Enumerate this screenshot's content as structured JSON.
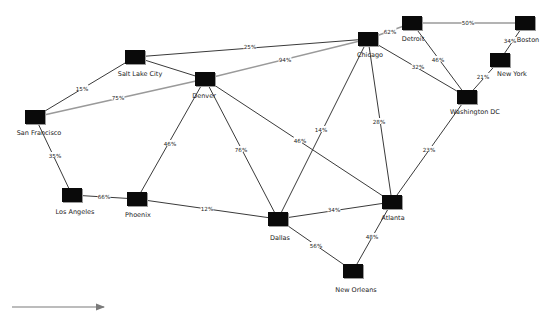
{
  "diagram": {
    "type": "network-graph",
    "nodes": [
      {
        "id": "slc",
        "label": "Salt Lake City",
        "x": 135,
        "y": 57,
        "lx": 140,
        "ly": 76
      },
      {
        "id": "den",
        "label": "Denver",
        "x": 205,
        "y": 79,
        "lx": 204,
        "ly": 98
      },
      {
        "id": "sf",
        "label": "San Francisco",
        "x": 35,
        "y": 117,
        "lx": 39,
        "ly": 135
      },
      {
        "id": "chi",
        "label": "Chicago",
        "x": 368,
        "y": 39,
        "lx": 370,
        "ly": 57
      },
      {
        "id": "det",
        "label": "Detroit",
        "x": 412,
        "y": 23,
        "lx": 413,
        "ly": 41
      },
      {
        "id": "bos",
        "label": "Boston",
        "x": 525,
        "y": 23,
        "lx": 528,
        "ly": 42
      },
      {
        "id": "ny",
        "label": "New York",
        "x": 500,
        "y": 60,
        "lx": 512,
        "ly": 76
      },
      {
        "id": "dc",
        "label": "Washington DC",
        "x": 467,
        "y": 97,
        "lx": 475,
        "ly": 114
      },
      {
        "id": "la",
        "label": "Los Angeles",
        "x": 72,
        "y": 195,
        "lx": 75,
        "ly": 214
      },
      {
        "id": "phx",
        "label": "Phoenix",
        "x": 137,
        "y": 199,
        "lx": 138,
        "ly": 217
      },
      {
        "id": "dal",
        "label": "Dallas",
        "x": 278,
        "y": 219,
        "lx": 280,
        "ly": 240
      },
      {
        "id": "atl",
        "label": "Atlanta",
        "x": 392,
        "y": 202,
        "lx": 393,
        "ly": 220
      },
      {
        "id": "no",
        "label": "New Orleans",
        "x": 353,
        "y": 271,
        "lx": 356,
        "ly": 292
      }
    ],
    "edges": [
      {
        "from": "sf",
        "to": "slc",
        "label": "15%",
        "lx": 82,
        "ly": 89,
        "style": "normal"
      },
      {
        "from": "sf",
        "to": "den",
        "label": "75%",
        "lx": 118,
        "ly": 98,
        "style": "highlight"
      },
      {
        "from": "slc",
        "to": "chi",
        "label": "25%",
        "lx": 250,
        "ly": 47,
        "style": "normal"
      },
      {
        "from": "slc",
        "to": "den",
        "label": "",
        "lx": 0,
        "ly": 0,
        "style": "normal"
      },
      {
        "from": "den",
        "to": "chi",
        "label": "94%",
        "lx": 285,
        "ly": 60,
        "style": "highlight"
      },
      {
        "from": "sf",
        "to": "la",
        "label": "35%",
        "lx": 55,
        "ly": 156,
        "style": "normal"
      },
      {
        "from": "den",
        "to": "phx",
        "label": "46%",
        "lx": 170,
        "ly": 144,
        "style": "normal"
      },
      {
        "from": "den",
        "to": "dal",
        "label": "76%",
        "lx": 241,
        "ly": 150,
        "style": "normal"
      },
      {
        "from": "den",
        "to": "atl",
        "label": "46%",
        "lx": 300,
        "ly": 141,
        "style": "normal"
      },
      {
        "from": "la",
        "to": "phx",
        "label": "66%",
        "lx": 104,
        "ly": 197,
        "style": "normal"
      },
      {
        "from": "phx",
        "to": "dal",
        "label": "12%",
        "lx": 207,
        "ly": 209,
        "style": "normal"
      },
      {
        "from": "chi",
        "to": "dal",
        "label": "14%",
        "lx": 321,
        "ly": 130,
        "style": "normal"
      },
      {
        "from": "chi",
        "to": "atl",
        "label": "28%",
        "lx": 379,
        "ly": 122,
        "style": "normal"
      },
      {
        "from": "chi",
        "to": "det",
        "label": "62%",
        "lx": 390,
        "ly": 32,
        "style": "highlight"
      },
      {
        "from": "chi",
        "to": "dc",
        "label": "32%",
        "lx": 418,
        "ly": 67,
        "style": "normal"
      },
      {
        "from": "det",
        "to": "dc",
        "label": "46%",
        "lx": 438,
        "ly": 60,
        "style": "normal"
      },
      {
        "from": "det",
        "to": "bos",
        "label": "50%",
        "lx": 468,
        "ly": 23,
        "style": "highlight"
      },
      {
        "from": "bos",
        "to": "ny",
        "label": "34%",
        "lx": 510,
        "ly": 41,
        "style": "normal"
      },
      {
        "from": "ny",
        "to": "dc",
        "label": "21%",
        "lx": 483,
        "ly": 77,
        "style": "normal"
      },
      {
        "from": "dc",
        "to": "atl",
        "label": "23%",
        "lx": 429,
        "ly": 150,
        "style": "normal"
      },
      {
        "from": "dal",
        "to": "atl",
        "label": "34%",
        "lx": 334,
        "ly": 210,
        "style": "normal"
      },
      {
        "from": "dal",
        "to": "no",
        "label": "56%",
        "lx": 316,
        "ly": 246,
        "style": "normal"
      },
      {
        "from": "atl",
        "to": "no",
        "label": "48%",
        "lx": 372,
        "ly": 237,
        "style": "normal"
      }
    ]
  },
  "legend": {
    "arrow": {
      "x1": 12,
      "y1": 307,
      "x2": 104,
      "y2": 307,
      "color": "#7a7a7a"
    }
  },
  "colors": {
    "node": "#0a0a0a",
    "node_shadow": "#9a9a9a",
    "edge": "#3a3a3a",
    "edge_highlight": "#9a9a9a",
    "background": "#ffffff"
  }
}
